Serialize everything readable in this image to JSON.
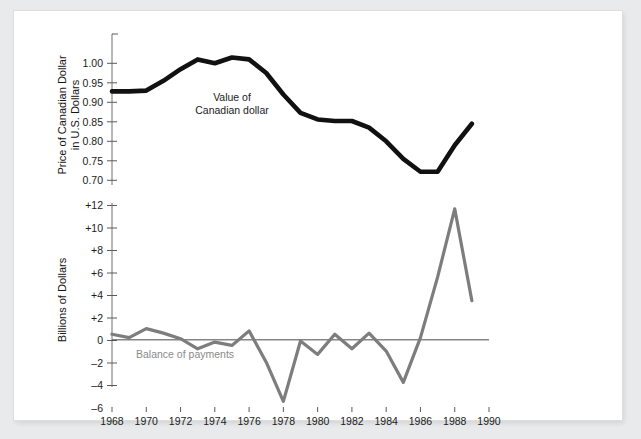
{
  "figure": {
    "background_color": "#e9eaec",
    "panel_color": "#ffffff"
  },
  "chart_data": [
    {
      "id": "canadian-dollar-value",
      "type": "line",
      "title": "",
      "xlabel": "",
      "ylabel": "Price of Canadian Dollar in U.S. Dollars",
      "ylabel_line1": "Price of Canadian Dollar",
      "ylabel_line2": "in U.S. Dollars",
      "annotation": "Value of Canadian dollar",
      "annotation_line1": "Value of",
      "annotation_line2": "Canadian dollar",
      "series_color": "#111111",
      "grid": false,
      "legend": "none",
      "xlim": [
        1968,
        1990
      ],
      "ylim": [
        0.7,
        1.035
      ],
      "yticks": [
        0.7,
        0.75,
        0.8,
        0.85,
        0.9,
        0.95,
        1.0
      ],
      "ytick_labels": [
        "0.70",
        "0.75",
        "0.80",
        "0.85",
        "0.90",
        "0.95",
        "1.00"
      ],
      "x": [
        1968,
        1969,
        1970,
        1971,
        1972,
        1973,
        1974,
        1975,
        1976,
        1977,
        1978,
        1979,
        1980,
        1981,
        1982,
        1983,
        1984,
        1985,
        1986,
        1987,
        1988,
        1989
      ],
      "values": [
        0.928,
        0.928,
        0.93,
        0.955,
        0.985,
        1.01,
        1.0,
        1.015,
        1.01,
        0.975,
        0.92,
        0.873,
        0.856,
        0.852,
        0.852,
        0.835,
        0.8,
        0.755,
        0.722,
        0.722,
        0.79,
        0.845
      ]
    },
    {
      "id": "balance-of-payments",
      "type": "line",
      "title": "",
      "xlabel": "",
      "ylabel": "Billions of Dollars",
      "annotation": "Balance of payments",
      "series_color": "#7d7d7d",
      "grid": false,
      "legend": "none",
      "xlim": [
        1968,
        1990
      ],
      "ylim": [
        -6.5,
        12.5
      ],
      "yticks": [
        -6,
        -4,
        -2,
        0,
        2,
        4,
        6,
        8,
        10,
        12
      ],
      "ytick_labels": [
        "–6",
        "–4",
        "–2",
        "0",
        "+2",
        "+4",
        "+6",
        "+8",
        "+10",
        "+12"
      ],
      "x": [
        1968,
        1969,
        1970,
        1971,
        1972,
        1973,
        1974,
        1975,
        1976,
        1977,
        1978,
        1979,
        1980,
        1981,
        1982,
        1983,
        1984,
        1985,
        1986,
        1987,
        1988,
        1989
      ],
      "values": [
        0.5,
        0.2,
        1.0,
        0.6,
        0.1,
        -0.8,
        -0.2,
        -0.5,
        0.8,
        -2.0,
        -5.5,
        -0.1,
        -1.3,
        0.5,
        -0.8,
        0.6,
        -1.0,
        -3.8,
        0.2,
        5.6,
        11.7,
        3.5
      ]
    }
  ],
  "xaxis": {
    "ticks": [
      1968,
      1969,
      1970,
      1971,
      1972,
      1973,
      1974,
      1975,
      1976,
      1977,
      1978,
      1979,
      1980,
      1981,
      1982,
      1983,
      1984,
      1985,
      1986,
      1987,
      1988,
      1989,
      1990
    ],
    "labeled_ticks": [
      1968,
      1970,
      1972,
      1974,
      1976,
      1978,
      1980,
      1982,
      1984,
      1986,
      1988,
      1990
    ],
    "labels": [
      "1968",
      "1970",
      "1972",
      "1974",
      "1976",
      "1978",
      "1980",
      "1982",
      "1984",
      "1986",
      "1988",
      "1990"
    ]
  },
  "labels": {
    "upper_ylabel_line1": "Price of Canadian Dollar",
    "upper_ylabel_line2": "in U.S. Dollars",
    "lower_ylabel": "Billions of Dollars",
    "upper_annotation_line1": "Value of",
    "upper_annotation_line2": "Canadian dollar",
    "lower_annotation": "Balance of payments",
    "yticks_upper": [
      "1.00",
      "0.95",
      "0.90",
      "0.85",
      "0.80",
      "0.75",
      "0.70"
    ],
    "yticks_lower": [
      "+12",
      "+10",
      "+8",
      "+6",
      "+4",
      "+2",
      "0",
      "–2",
      "–4",
      "–6"
    ]
  }
}
